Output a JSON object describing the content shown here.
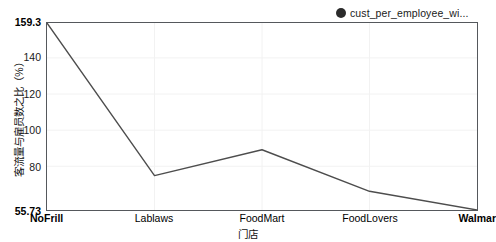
{
  "legend": {
    "label": "cust_per_employee_wi...",
    "marker_color": "#2b2b2b",
    "position": "top-right"
  },
  "axes": {
    "y_title": "客流量与雇员数之比（%）",
    "x_title": "门店",
    "y_ticks": [
      "159.3",
      "140",
      "120",
      "100",
      "80",
      "55.73"
    ],
    "x_ticks": [
      "NoFrill",
      "Lablaws",
      "FoodMart",
      "FoodLovers",
      "Walmar"
    ]
  },
  "chart_data": {
    "type": "line",
    "title": "",
    "subtitle": "",
    "xlabel": "门店",
    "ylabel": "客流量与雇员数之比（%）",
    "categories": [
      "NoFrill",
      "Lablaws",
      "FoodMart",
      "FoodLovers",
      "Walmar"
    ],
    "series": [
      {
        "name": "cust_per_employee_wi...",
        "color": "#4d4d4d",
        "values": [
          159.3,
          74.8,
          89.1,
          66.1,
          55.73
        ]
      }
    ],
    "ylim": [
      55.73,
      159.3
    ],
    "ytick_values": [
      159.3,
      140,
      120,
      100,
      80,
      55.73
    ],
    "xtick_labels": [
      "NoFrill",
      "Lablaws",
      "FoodMart",
      "FoodLovers",
      "Walmar"
    ],
    "grid": {
      "horizontal": true,
      "vertical": true,
      "color": "#f0f0f0"
    },
    "legend_position": "top-right",
    "markers": false,
    "line_color": "#4d4d4d",
    "plot_border_color": "#55585c",
    "background": "#ffffff"
  }
}
